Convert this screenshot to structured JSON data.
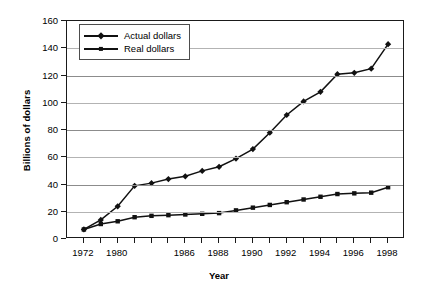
{
  "chart_data": {
    "type": "line",
    "title": "",
    "xlabel": "Year",
    "ylabel": "Billions of dollars",
    "ylim": [
      0,
      160
    ],
    "yticks": [
      0,
      20,
      40,
      60,
      80,
      100,
      120,
      140,
      160
    ],
    "grid": true,
    "legend_position": "top-left",
    "x": [
      1972,
      1978,
      1980,
      1982,
      1984,
      1985,
      1986,
      1987,
      1988,
      1989,
      1990,
      1991,
      1992,
      1993,
      1994,
      1995,
      1996,
      1997,
      1998
    ],
    "xtick_labels": [
      "1972",
      "1980",
      "1986",
      "1988",
      "1990",
      "1992",
      "1994",
      "1996",
      "1998"
    ],
    "xtick_index": [
      0,
      2,
      6,
      8,
      10,
      12,
      14,
      16,
      18
    ],
    "series": [
      {
        "name": "Actual dollars",
        "marker": "diamond",
        "color": "#111111",
        "values": [
          7,
          14,
          24,
          39,
          41,
          44,
          46,
          50,
          53,
          59,
          66,
          78,
          91,
          101,
          108,
          121,
          122,
          125,
          143
        ]
      },
      {
        "name": "Real dollars",
        "marker": "square",
        "color": "#111111",
        "values": [
          7,
          11,
          13,
          16,
          17,
          17.5,
          18,
          18.5,
          19,
          21,
          23,
          25,
          27,
          29,
          31,
          33,
          33.5,
          34,
          38
        ]
      }
    ]
  },
  "legend": {
    "items": [
      {
        "label": "Actual dollars",
        "marker": "diamond"
      },
      {
        "label": "Real dollars",
        "marker": "square"
      }
    ]
  },
  "axes": {
    "x_title": "Year",
    "y_title": "Billions of dollars"
  }
}
